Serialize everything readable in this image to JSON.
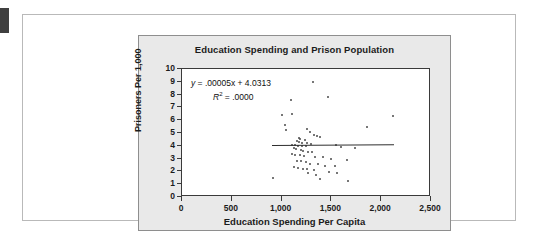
{
  "figure": {
    "margin_tab": "dark-tab"
  },
  "chart_data": {
    "type": "scatter",
    "title": "Education Spending and Prison Population",
    "xlabel": "Education Spending Per Capita",
    "ylabel": "Prisoners Per 1,000",
    "xlim": [
      0,
      2500
    ],
    "ylim": [
      0,
      10
    ],
    "xticks": [
      0,
      500,
      1000,
      1500,
      2000,
      2500
    ],
    "xticklabels": [
      "0",
      "500",
      "1,000",
      "1,500",
      "2,000",
      "2,500"
    ],
    "yticks": [
      0,
      1,
      2,
      3,
      4,
      5,
      6,
      7,
      8,
      9,
      10
    ],
    "yticklabels": [
      "0",
      "1",
      "2",
      "3",
      "4",
      "5",
      "6",
      "7",
      "8",
      "9",
      "10"
    ],
    "grid": false,
    "legend": null,
    "annotations": {
      "equation": "y = .00005x + 4.0313",
      "equation_prefix": "y",
      "equation_body": " = .00005x + 4.0313",
      "r_squared_label": "R",
      "r_squared_exp": "2",
      "r_squared_value": " = .0000"
    },
    "trendline": {
      "slope": 5e-05,
      "intercept": 4.0313,
      "x_start": 900,
      "x_end": 2120,
      "y_start": 4.08,
      "y_end": 4.14,
      "color": "#2e2e2e"
    },
    "point_color": "#4a4a4a",
    "points": [
      [
        1320,
        9.0
      ],
      [
        1470,
        7.85
      ],
      [
        1090,
        7.6
      ],
      [
        1000,
        6.4
      ],
      [
        1100,
        6.5
      ],
      [
        2120,
        6.3
      ],
      [
        1030,
        5.6
      ],
      [
        1040,
        5.2
      ],
      [
        1260,
        5.35
      ],
      [
        1860,
        5.45
      ],
      [
        1290,
        5.05
      ],
      [
        1330,
        4.85
      ],
      [
        1360,
        4.75
      ],
      [
        1390,
        4.7
      ],
      [
        1175,
        4.6
      ],
      [
        1185,
        4.55
      ],
      [
        1230,
        4.45
      ],
      [
        1150,
        4.35
      ],
      [
        1170,
        4.3
      ],
      [
        1200,
        4.25
      ],
      [
        1255,
        4.2
      ],
      [
        1300,
        4.15
      ],
      [
        1100,
        4.1
      ],
      [
        1130,
        4.05
      ],
      [
        1160,
        4.0
      ],
      [
        1205,
        3.98
      ],
      [
        1240,
        3.95
      ],
      [
        1550,
        4.1
      ],
      [
        1600,
        3.9
      ],
      [
        1740,
        3.85
      ],
      [
        1120,
        3.8
      ],
      [
        1145,
        3.75
      ],
      [
        1190,
        3.7
      ],
      [
        1215,
        3.6
      ],
      [
        1265,
        3.55
      ],
      [
        1310,
        3.5
      ],
      [
        1100,
        3.35
      ],
      [
        1135,
        3.3
      ],
      [
        1180,
        3.25
      ],
      [
        1225,
        3.2
      ],
      [
        1340,
        3.15
      ],
      [
        1420,
        3.1
      ],
      [
        1500,
        2.95
      ],
      [
        1660,
        2.9
      ],
      [
        1150,
        2.85
      ],
      [
        1195,
        2.8
      ],
      [
        1245,
        2.75
      ],
      [
        1290,
        2.6
      ],
      [
        1370,
        2.55
      ],
      [
        1440,
        2.45
      ],
      [
        1540,
        2.4
      ],
      [
        1120,
        2.35
      ],
      [
        1165,
        2.3
      ],
      [
        1210,
        2.2
      ],
      [
        1255,
        2.15
      ],
      [
        1330,
        2.1
      ],
      [
        1480,
        1.95
      ],
      [
        1555,
        1.9
      ],
      [
        1270,
        1.85
      ],
      [
        1350,
        1.75
      ],
      [
        910,
        1.5
      ],
      [
        1390,
        1.4
      ],
      [
        1670,
        1.25
      ]
    ]
  }
}
